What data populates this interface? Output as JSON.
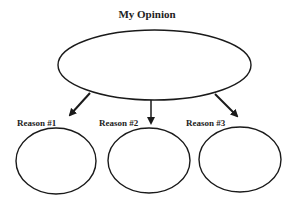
{
  "title": "My Opinion",
  "reasons": [
    {
      "label": "Reason #1"
    },
    {
      "label": "Reason #2"
    },
    {
      "label": "Reason #3"
    }
  ],
  "colors": {
    "stroke": "#1a1a1a",
    "background": "#ffffff"
  }
}
